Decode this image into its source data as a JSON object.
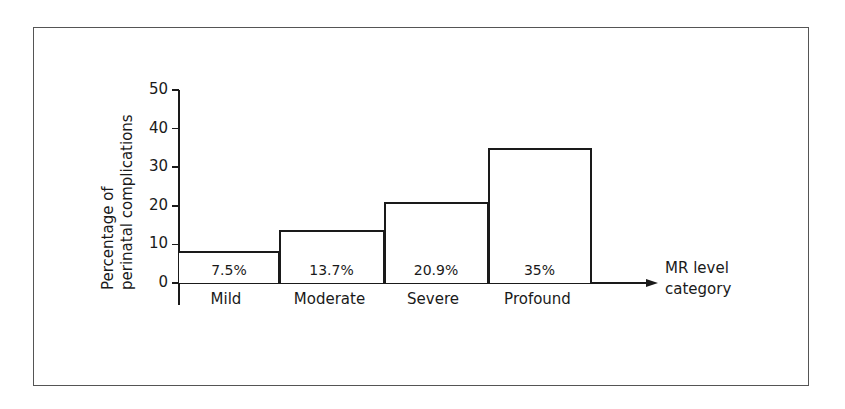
{
  "chart_data": {
    "type": "bar",
    "title": "",
    "xlabel": "MR level category",
    "xlabel_lines": [
      "MR level",
      "category"
    ],
    "ylabel": "Percentage of perinatal complications",
    "ylabel_lines": [
      "Percentage of",
      "perinatal complications"
    ],
    "categories": [
      "Mild",
      "Moderate",
      "Severe",
      "Profound"
    ],
    "values": [
      7.5,
      13.7,
      20.9,
      35
    ],
    "value_labels": [
      "7.5%",
      "13.7%",
      "20.9%",
      "35%"
    ],
    "ylim": [
      0,
      50
    ],
    "yticks": [
      0,
      10,
      20,
      30,
      40,
      50
    ],
    "ytick_labels": [
      "0",
      "10",
      "20",
      "30",
      "40",
      "50"
    ],
    "grid": false,
    "legend": null
  }
}
